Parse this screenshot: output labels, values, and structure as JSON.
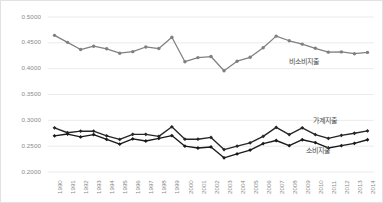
{
  "chart_data": {
    "type": "line",
    "title": "",
    "xlabel": "",
    "ylabel": "",
    "ylim": [
      0.2,
      0.5
    ],
    "ytick_labels": [
      "0.5000",
      "0.4500",
      "0.4000",
      "0.3500",
      "0.3000",
      "0.2500",
      "0.2000"
    ],
    "ytick_values": [
      0.5,
      0.45,
      0.4,
      0.35,
      0.3,
      0.25,
      0.2
    ],
    "grid": true,
    "legend_position": "inline-annotation",
    "categories": [
      "1990",
      "1991",
      "1992",
      "1993",
      "1994",
      "1995",
      "1996",
      "1997",
      "1998",
      "1999",
      "2000",
      "2001",
      "2002",
      "2003",
      "2004",
      "2005",
      "2006",
      "2007",
      "2008",
      "2009",
      "2010",
      "2011",
      "2012",
      "2013",
      "2014"
    ],
    "series": [
      {
        "name": "비소비지출",
        "color": "#808080",
        "marker": "circle",
        "values": [
          0.4635,
          0.45,
          0.436,
          0.4425,
          0.4375,
          0.429,
          0.432,
          0.441,
          0.438,
          0.46,
          0.4125,
          0.4205,
          0.4225,
          0.395,
          0.4135,
          0.421,
          0.4395,
          0.462,
          0.453,
          0.4465,
          0.4385,
          0.431,
          0.4315,
          0.428,
          0.4305
        ]
      },
      {
        "name": "가계지출",
        "color": "#262626",
        "marker": "diamond",
        "values": [
          0.2845,
          0.275,
          0.278,
          0.278,
          0.269,
          0.262,
          0.272,
          0.272,
          0.268,
          0.2865,
          0.2625,
          0.2625,
          0.266,
          0.2425,
          0.249,
          0.2555,
          0.268,
          0.2855,
          0.2715,
          0.2845,
          0.2715,
          0.264,
          0.27,
          0.274,
          0.2785
        ]
      },
      {
        "name": "소비지출",
        "color": "#1a1a1a",
        "marker": "diamond",
        "values": [
          0.269,
          0.2725,
          0.267,
          0.2715,
          0.262,
          0.253,
          0.263,
          0.259,
          0.264,
          0.2695,
          0.249,
          0.2455,
          0.2475,
          0.2265,
          0.234,
          0.2415,
          0.254,
          0.26,
          0.25,
          0.2615,
          0.256,
          0.2455,
          0.25,
          0.2545,
          0.2615
        ]
      }
    ],
    "annotations": [
      {
        "text": "비소비지출",
        "series": "비소비지출"
      },
      {
        "text": "가계지출",
        "series": "가계지출"
      },
      {
        "text": "소비지출",
        "series": "소비지출"
      }
    ],
    "axis_colors": {
      "grid": "#ebebeb",
      "tick_text": "#8a8a8a",
      "border": "#e2e2e2"
    }
  }
}
